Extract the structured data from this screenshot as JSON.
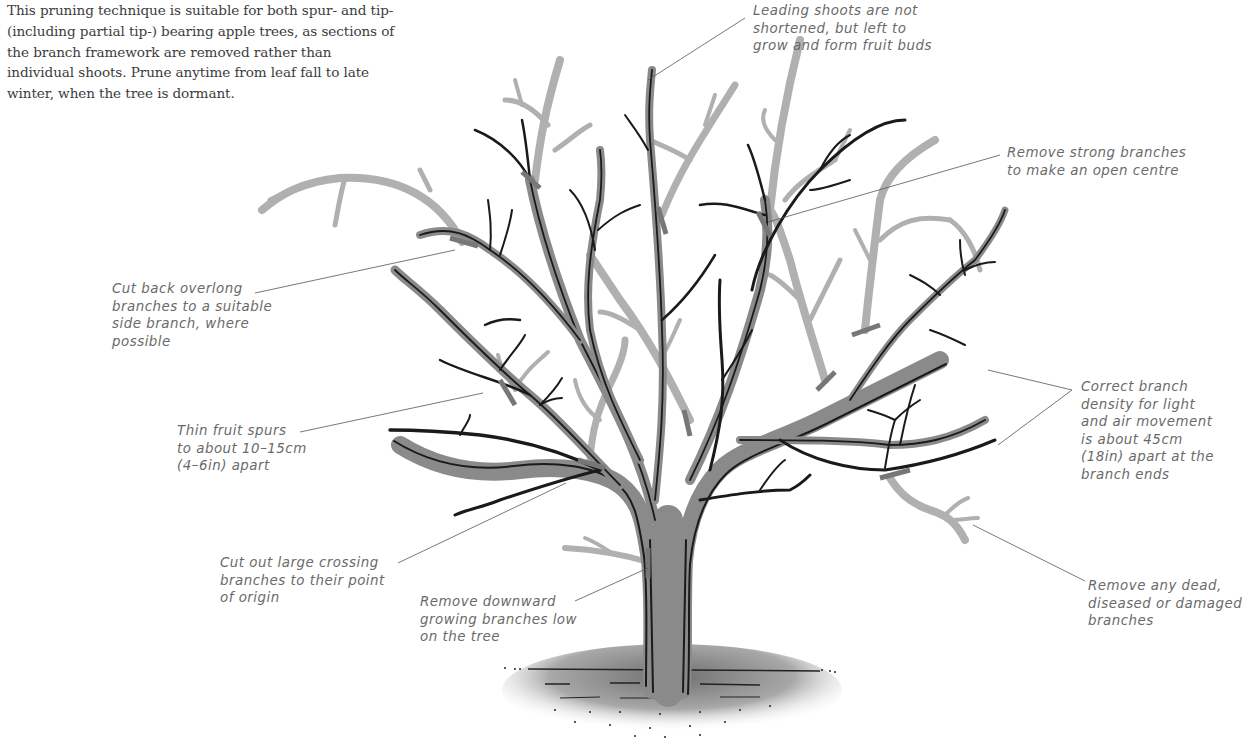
{
  "intro": {
    "text": "This pruning technique is suitable for both spur- and tip- (including partial tip-) bearing apple trees, as sections of the branch framework are removed rather than individual shoots. Prune anytime from leaf fall to late winter, when the tree is dormant."
  },
  "labels": {
    "leading_shoots": "Leading shoots are not\nshortened, but left to\ngrow and form fruit buds",
    "open_centre": "Remove strong branches\nto make an open centre",
    "overlong": "Cut back overlong\nbranches to a suitable\nside branch, where\npossible",
    "fruit_spurs": "Thin fruit spurs\nto about 10–15cm\n(4–6in) apart",
    "crossing": "Cut out large crossing\nbranches to their point\nof origin",
    "downward": "Remove downward\ngrowing branches low\non the tree",
    "density": "Correct branch\ndensity for light\nand air movement\nis about 45cm\n(18in) apart at the\nbranch ends",
    "dead": "Remove any dead,\ndiseased or damaged\nbranches"
  },
  "illustration": {
    "subject": "apple-tree-pruning-diagram",
    "colors": {
      "retained_branch": "#1a1a1a",
      "branch_shading": "#8a8a8a",
      "pruned_branch": "#b0b0b0",
      "cut_mark": "#777777",
      "label_text": "#6a6a6a",
      "body_text": "#3c3c3c"
    }
  }
}
